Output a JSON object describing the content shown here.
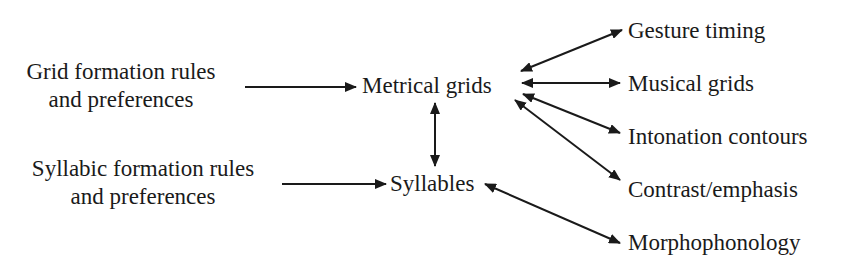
{
  "diagram": {
    "inputs": [
      {
        "id": "grid-rules",
        "lines": [
          "Grid formation rules",
          "and preferences"
        ]
      },
      {
        "id": "syllabic-rules",
        "lines": [
          "Syllabic formation rules",
          "and preferences"
        ]
      }
    ],
    "central": [
      {
        "id": "metrical-grids",
        "label": "Metrical grids"
      },
      {
        "id": "syllables",
        "label": "Syllables"
      }
    ],
    "outputs": [
      {
        "id": "gesture-timing",
        "label": "Gesture timing"
      },
      {
        "id": "musical-grids",
        "label": "Musical grids"
      },
      {
        "id": "intonation-contours",
        "label": "Intonation contours"
      },
      {
        "id": "contrast-emphasis",
        "label": "Contrast/emphasis"
      },
      {
        "id": "morphophonology",
        "label": "Morphophonology"
      }
    ],
    "edges": [
      {
        "from": "Grid formation rules and preferences",
        "to": "Metrical grids",
        "type": "one-way"
      },
      {
        "from": "Syllabic formation rules and preferences",
        "to": "Syllables",
        "type": "one-way"
      },
      {
        "from": "Metrical grids",
        "to": "Syllables",
        "type": "two-way"
      },
      {
        "from": "Metrical grids",
        "to": "Gesture timing",
        "type": "two-way"
      },
      {
        "from": "Metrical grids",
        "to": "Musical grids",
        "type": "two-way"
      },
      {
        "from": "Metrical grids",
        "to": "Intonation contours",
        "type": "two-way"
      },
      {
        "from": "Metrical grids",
        "to": "Contrast/emphasis",
        "type": "two-way"
      },
      {
        "from": "Syllables",
        "to": "Morphophonology",
        "type": "two-way"
      }
    ],
    "colors": {
      "ink": "#1a1a1a",
      "background": "#ffffff"
    }
  }
}
